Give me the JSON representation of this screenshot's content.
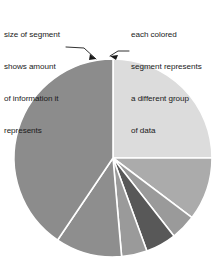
{
  "figure": {
    "background": "#ffffff",
    "caption_color": "#1a1a1a"
  },
  "annotations": {
    "left": {
      "name": "segment-size-annotation",
      "lines": [
        "size of segment",
        "shows amount",
        "of information it",
        "represents"
      ],
      "leader": {
        "name": "left-leader-line",
        "points": "66,47 84,48 96,59",
        "arrow": "96,59 90,54 89,60"
      }
    },
    "right": {
      "name": "segment-color-annotation",
      "lines": [
        "each colored",
        "segment represents",
        "a different group",
        "of data"
      ],
      "leader": {
        "name": "right-leader-line",
        "points": "129,51 118,51 110,56",
        "arrow": "110,56 118,55 116,60"
      }
    }
  },
  "chart_data": {
    "type": "pie",
    "title": "",
    "xlabel": "",
    "ylabel": "",
    "legend": "none",
    "grid": false,
    "center": {
      "x": 113,
      "y": 158
    },
    "radius": 99,
    "start_angle_deg": 0,
    "direction": "clockwise",
    "separator_color": "#ffffff",
    "separator_width": 1.6,
    "categories": [
      "group 1",
      "group 2",
      "group 3",
      "group 4",
      "group 5",
      "group 6",
      "group 7"
    ],
    "values": [
      25.0,
      10.3,
      4.2,
      5.0,
      4.2,
      10.8,
      40.5
    ],
    "angles_deg": [
      90.0,
      37.0,
      15.0,
      18.0,
      15.0,
      39.0,
      146.0
    ],
    "colors": [
      "#dcdcdc",
      "#ababab",
      "#9a9a9a",
      "#585858",
      "#9a9a9a",
      "#8e8e8e",
      "#8c8c8c"
    ],
    "slices": [
      {
        "label": "group 1",
        "value": 25.0,
        "start_deg": 0.0,
        "end_deg": 90.0,
        "color": "#dcdcdc"
      },
      {
        "label": "group 2",
        "value": 10.3,
        "start_deg": 90.0,
        "end_deg": 127.0,
        "color": "#ababab"
      },
      {
        "label": "group 3",
        "value": 4.2,
        "start_deg": 127.0,
        "end_deg": 142.0,
        "color": "#9a9a9a"
      },
      {
        "label": "group 4",
        "value": 5.0,
        "start_deg": 142.0,
        "end_deg": 160.0,
        "color": "#585858"
      },
      {
        "label": "group 5",
        "value": 4.2,
        "start_deg": 160.0,
        "end_deg": 175.0,
        "color": "#9a9a9a"
      },
      {
        "label": "group 6",
        "value": 10.8,
        "start_deg": 175.0,
        "end_deg": 214.0,
        "color": "#8e8e8e"
      },
      {
        "label": "group 7",
        "value": 40.5,
        "start_deg": 214.0,
        "end_deg": 360.0,
        "color": "#8c8c8c"
      }
    ]
  }
}
